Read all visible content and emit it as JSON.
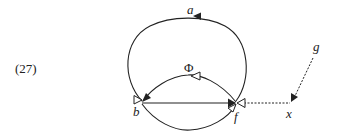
{
  "example_number": "(27)",
  "nodes": {
    "a": {
      "label": "a",
      "x": 190,
      "y": 13
    },
    "phi": {
      "label": "Φ",
      "x": 189,
      "y": 71
    },
    "b": {
      "label": "b",
      "x": 137,
      "y": 116
    },
    "f": {
      "label": "f",
      "x": 236,
      "y": 120
    },
    "x": {
      "label": "x",
      "x": 289,
      "y": 117
    },
    "g": {
      "label": "g",
      "x": 315,
      "y": 52
    }
  },
  "edges": [
    {
      "id": "b-a-f arc",
      "style": "solid",
      "arrow": "filled",
      "description": "large arc from f over a to b"
    },
    {
      "id": "phi arc",
      "style": "solid",
      "arrow": "hollow+filled",
      "description": "arc from f to b labeled Φ"
    },
    {
      "id": "b-f line",
      "style": "solid",
      "arrow": "filled",
      "description": "straight line from b to f"
    },
    {
      "id": "lower arc",
      "style": "solid",
      "arrow": "hollow",
      "description": "lower arc from b to f"
    },
    {
      "id": "x-f",
      "style": "dotted",
      "arrow": "hollow",
      "description": "dotted line from x to f"
    },
    {
      "id": "g-x",
      "style": "dotted",
      "arrow": "filled",
      "description": "dotted line from g to x"
    }
  ],
  "colors": {
    "stroke": "#222222",
    "background": "#ffffff"
  }
}
